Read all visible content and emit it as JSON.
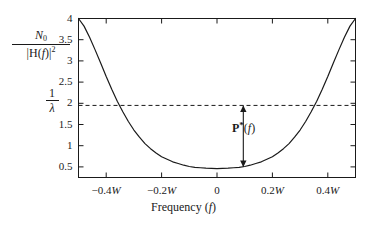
{
  "chart_data": {
    "type": "line",
    "title": "",
    "xlabel": "Frequency (f)",
    "ylabel": "N0/|H(f)|^2",
    "xlim": [
      -0.5,
      0.5
    ],
    "ylim": [
      0.25,
      4.0
    ],
    "grid": false,
    "legend": "none",
    "x_tick_values": [
      -0.4,
      -0.2,
      0,
      0.2,
      0.4
    ],
    "x_tick_labels": [
      "−0.4W",
      "−0.2W",
      "0",
      "0.2W",
      "0.4W"
    ],
    "y_tick_values": [
      0.5,
      1,
      1.5,
      2,
      2.5,
      3,
      3.5,
      4
    ],
    "y_tick_labels": [
      "0.5",
      "1",
      "1.5",
      "2",
      "2.5",
      "3",
      "3.5",
      "4"
    ],
    "series": [
      {
        "name": "N0/|H(f)|^2",
        "style": "solid",
        "x": [
          -0.5,
          -0.48,
          -0.46,
          -0.44,
          -0.42,
          -0.4,
          -0.38,
          -0.36,
          -0.34,
          -0.32,
          -0.3,
          -0.28,
          -0.26,
          -0.24,
          -0.22,
          -0.2,
          -0.18,
          -0.16,
          -0.14,
          -0.12,
          -0.1,
          -0.08,
          -0.06,
          -0.04,
          -0.02,
          0.0,
          0.02,
          0.04,
          0.06,
          0.08,
          0.1,
          0.12,
          0.14,
          0.16,
          0.18,
          0.2,
          0.22,
          0.24,
          0.26,
          0.28,
          0.3,
          0.32,
          0.34,
          0.36,
          0.38,
          0.4,
          0.42,
          0.44,
          0.46,
          0.48,
          0.5
        ],
        "y": [
          4.0,
          3.82,
          3.56,
          3.26,
          2.95,
          2.63,
          2.33,
          2.05,
          1.8,
          1.57,
          1.37,
          1.2,
          1.05,
          0.93,
          0.83,
          0.74,
          0.68,
          0.62,
          0.58,
          0.54,
          0.51,
          0.49,
          0.48,
          0.47,
          0.465,
          0.46,
          0.465,
          0.47,
          0.48,
          0.49,
          0.51,
          0.54,
          0.58,
          0.62,
          0.68,
          0.74,
          0.83,
          0.93,
          1.05,
          1.2,
          1.37,
          1.57,
          1.8,
          2.05,
          2.33,
          2.63,
          2.95,
          3.26,
          3.56,
          3.82,
          4.0
        ]
      }
    ],
    "reference_lines": [
      {
        "name": "inverse-lambda-level",
        "orientation": "horizontal",
        "value": 1.95,
        "style": "dashed",
        "label": "1/λ"
      }
    ],
    "annotations": [
      {
        "name": "p-star-arrow",
        "label": "P*(f)",
        "x": 0.095,
        "y_from": 0.5,
        "y_to": 1.95,
        "arrow": "double-headed"
      }
    ]
  },
  "labels": {
    "y_axis": {
      "numerator_n": "N",
      "numerator_sub": "0",
      "den_open": "|H(",
      "den_f": "f",
      "den_close": ")|",
      "den_sup": "2"
    },
    "lambda_level": {
      "numerator": "1",
      "denominator": "λ"
    },
    "x_axis_title_text": "Frequency (",
    "x_axis_title_var": "f",
    "x_axis_title_close": ")",
    "annotation": {
      "p": "P",
      "star": "*",
      "open": "(",
      "var": "f",
      "close": ")"
    },
    "y_ticks": [
      "4",
      "3.5",
      "3",
      "2.5",
      "2",
      "1.5",
      "1",
      "0.5"
    ],
    "x_ticks": [
      {
        "minus": "−",
        "num": "0.4",
        "w": "W"
      },
      {
        "minus": "−",
        "num": "0.2",
        "w": "W"
      },
      {
        "minus": "",
        "num": "0",
        "w": ""
      },
      {
        "minus": "",
        "num": "0.2",
        "w": "W"
      },
      {
        "minus": "",
        "num": "0.4",
        "w": "W"
      }
    ]
  },
  "colors": {
    "axis": "#1a1a1a",
    "curve": "#1a1a1a",
    "dashed": "#1a1a1a",
    "background": "#ffffff"
  }
}
